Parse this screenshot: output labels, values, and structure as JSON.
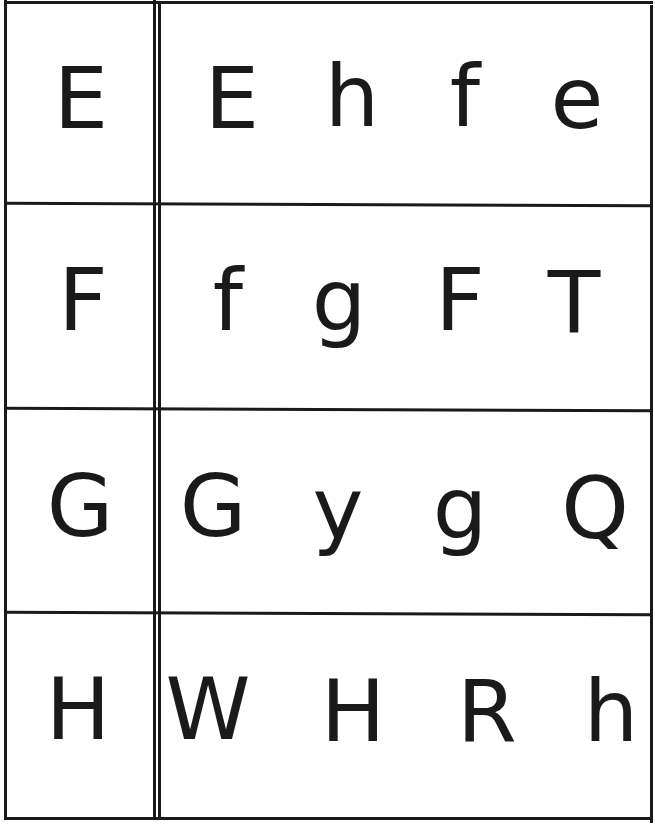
{
  "worksheet": {
    "title": "Letter recognition: match the letter",
    "rows": [
      {
        "target": "E",
        "choices": [
          "E",
          "h",
          "f",
          "e"
        ]
      },
      {
        "target": "F",
        "choices": [
          "f",
          "g",
          "F",
          "T"
        ]
      },
      {
        "target": "G",
        "choices": [
          "G",
          "y",
          "g",
          "Q"
        ]
      },
      {
        "target": "H",
        "choices": [
          "W",
          "H",
          "R",
          "h"
        ]
      }
    ]
  },
  "colors": {
    "ink": "#1a1a1a",
    "paper": "#ffffff"
  }
}
